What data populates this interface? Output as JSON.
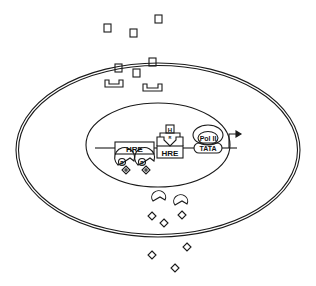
{
  "diagram": {
    "title": "",
    "colors": {
      "stroke": "#1a1a1a",
      "background": "#ffffff"
    },
    "labels": {
      "hre_left": "HRE",
      "hre_right": "HRE",
      "pol": "Pol II",
      "tata": "TATA",
      "hormone_bound": "H",
      "receptor_a": "R",
      "receptor_b": "R",
      "receptor_top": "R"
    },
    "components": {
      "cell_membrane": "outer double-line ellipse",
      "nucleus": "inner ellipse",
      "dna_strand": "horizontal line through nucleus",
      "transcription_start": "bent arrow after TATA",
      "extracellular_hormones": "small squares outside cell",
      "cytoplasmic_hormones": "small squares inside cell",
      "cytoplasmic_receptors": "U-shaped receptor brackets",
      "pac_shapes": "crescent/pac-man shapes near bottom",
      "diamonds": "small diamond molecules"
    }
  }
}
